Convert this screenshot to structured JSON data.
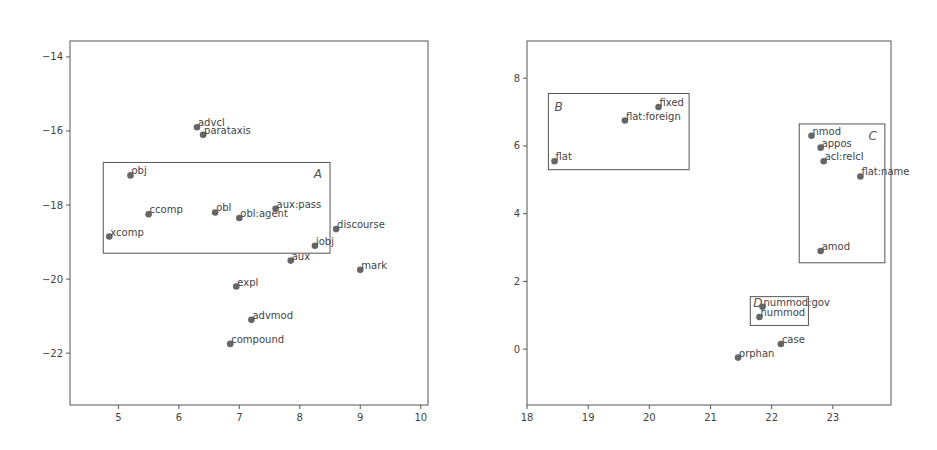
{
  "chart_data": [
    {
      "type": "scatter",
      "title": "",
      "xlabel": "",
      "ylabel": "",
      "grid": false,
      "xlim": [
        4.2,
        10.12
      ],
      "ylim": [
        -23.4,
        -13.57
      ],
      "xticks": [
        5,
        6,
        7,
        8,
        9,
        10
      ],
      "yticks": [
        -14,
        -16,
        -18,
        -20,
        -22
      ],
      "points": [
        {
          "label": "advcl",
          "x": 6.3,
          "y": -15.9
        },
        {
          "label": "parataxis",
          "x": 6.4,
          "y": -16.1
        },
        {
          "label": "obj",
          "x": 5.2,
          "y": -17.2
        },
        {
          "label": "ccomp",
          "x": 5.5,
          "y": -18.25
        },
        {
          "label": "obl",
          "x": 6.6,
          "y": -18.2
        },
        {
          "label": "obl:agent",
          "x": 7.0,
          "y": -18.35
        },
        {
          "label": "aux:pass",
          "x": 7.6,
          "y": -18.1
        },
        {
          "label": "xcomp",
          "x": 4.85,
          "y": -18.85
        },
        {
          "label": "discourse",
          "x": 8.6,
          "y": -18.65
        },
        {
          "label": "iobj",
          "x": 8.25,
          "y": -19.1
        },
        {
          "label": "aux",
          "x": 7.85,
          "y": -19.5
        },
        {
          "label": "mark",
          "x": 9.0,
          "y": -19.75
        },
        {
          "label": "expl",
          "x": 6.95,
          "y": -20.2
        },
        {
          "label": "advmod",
          "x": 7.2,
          "y": -21.1
        },
        {
          "label": "compound",
          "x": 6.85,
          "y": -21.75
        }
      ],
      "clusters": [
        {
          "name": "A",
          "x0": 4.75,
          "x1": 8.5,
          "y0": -19.3,
          "y1": -16.85
        }
      ]
    },
    {
      "type": "scatter",
      "title": "",
      "xlabel": "",
      "ylabel": "",
      "grid": false,
      "xlim": [
        18,
        23.95
      ],
      "ylim": [
        -1.65,
        9.1
      ],
      "xticks": [
        18,
        19,
        20,
        21,
        22,
        23
      ],
      "yticks": [
        0,
        2,
        4,
        6,
        8
      ],
      "points": [
        {
          "label": "fixed",
          "x": 20.15,
          "y": 7.15
        },
        {
          "label": "flat:foreign",
          "x": 19.6,
          "y": 6.75
        },
        {
          "label": "flat",
          "x": 18.45,
          "y": 5.55
        },
        {
          "label": "nmod",
          "x": 22.65,
          "y": 6.3
        },
        {
          "label": "appos",
          "x": 22.8,
          "y": 5.95
        },
        {
          "label": "acl:relcl",
          "x": 22.85,
          "y": 5.55
        },
        {
          "label": "flat:name",
          "x": 23.45,
          "y": 5.1
        },
        {
          "label": "amod",
          "x": 22.8,
          "y": 2.9
        },
        {
          "label": "nummod:gov",
          "x": 21.85,
          "y": 1.25
        },
        {
          "label": "nummod",
          "x": 21.8,
          "y": 0.95
        },
        {
          "label": "case",
          "x": 22.15,
          "y": 0.15
        },
        {
          "label": "orphan",
          "x": 21.45,
          "y": -0.25
        }
      ],
      "clusters": [
        {
          "name": "B",
          "x0": 18.35,
          "x1": 20.65,
          "y0": 5.3,
          "y1": 7.55
        },
        {
          "name": "C",
          "x0": 22.45,
          "x1": 23.85,
          "y0": 2.55,
          "y1": 6.65
        },
        {
          "name": "D",
          "x0": 21.65,
          "x1": 22.6,
          "y0": 0.7,
          "y1": 1.55
        }
      ]
    }
  ]
}
